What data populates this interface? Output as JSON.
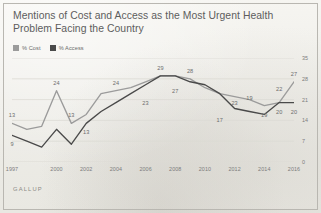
{
  "title": {
    "line1": "Mentions of Cost and Access as the Most Urgent Health",
    "line2": "Problem Facing the Country"
  },
  "legend": {
    "items": [
      {
        "label": "% Cost",
        "color": "#9b9b9b",
        "swatch_icon": "square-swatch-icon"
      },
      {
        "label": "% Access",
        "color": "#4a4a4a",
        "swatch_icon": "square-swatch-icon"
      }
    ]
  },
  "footer": {
    "brand": "GALLUP"
  },
  "colors": {
    "background": "#f2f1ed",
    "gridline": "#dcdad4",
    "axis_text": "#7c7c7c",
    "title_text": "#5d5d5d",
    "label_text": "#6d6d6d",
    "cost_line": "#9b9b9b",
    "access_line": "#4a4a4a"
  },
  "chart_data": {
    "type": "line",
    "title": "Mentions of Cost and Access as the Most Urgent Health Problem Facing the Country",
    "xlabel": "",
    "ylabel": "",
    "ylim": [
      0,
      35
    ],
    "yticks": [
      0,
      7,
      14,
      21,
      28,
      35
    ],
    "ytick_labels": [
      "0",
      "7",
      "14",
      "21",
      "28",
      "35"
    ],
    "y_axis_position": "right",
    "grid": true,
    "legend_position": "top-left",
    "x": [
      1997,
      1998,
      1999,
      2000,
      2001,
      2002,
      2003,
      2004,
      2005,
      2006,
      2007,
      2008,
      2009,
      2010,
      2011,
      2012,
      2013,
      2014,
      2015,
      2016
    ],
    "xtick_labels": [
      "1997",
      "2000",
      "2002",
      "2004",
      "2006",
      "2008",
      "2010",
      "2012",
      "2014",
      "2016"
    ],
    "xticks": [
      1997,
      2000,
      2002,
      2004,
      2006,
      2008,
      2010,
      2012,
      2014,
      2016
    ],
    "series": [
      {
        "name": "% Cost",
        "color": "#9b9b9b",
        "values": [
          13,
          11,
          12,
          24,
          13,
          16,
          23,
          24,
          25,
          27,
          29,
          29,
          28,
          25,
          23,
          22,
          21,
          19,
          20,
          27
        ],
        "labels": [
          {
            "x": 1997,
            "y": 13,
            "text": "13"
          },
          {
            "x": 2000,
            "y": 24,
            "text": "24"
          },
          {
            "x": 2001,
            "y": 13,
            "text": "13"
          },
          {
            "x": 2004,
            "y": 24,
            "text": "24"
          },
          {
            "x": 2007,
            "y": 29,
            "text": "29"
          },
          {
            "x": 2009,
            "y": 28,
            "text": "28"
          },
          {
            "x": 2013,
            "y": 19,
            "text": "19"
          },
          {
            "x": 2015,
            "y": 22,
            "text": "22"
          },
          {
            "x": 2016,
            "y": 27,
            "text": "27"
          }
        ]
      },
      {
        "name": "% Access",
        "color": "#4a4a4a",
        "values": [
          9,
          7,
          5,
          11,
          6,
          13,
          17,
          20,
          23,
          26,
          29,
          29,
          27,
          26,
          23,
          18,
          17,
          16,
          20,
          20
        ],
        "labels": [
          {
            "x": 1997,
            "y": 9,
            "text": "9"
          },
          {
            "x": 2002,
            "y": 13,
            "text": "13"
          },
          {
            "x": 2006,
            "y": 23,
            "text": "23"
          },
          {
            "x": 2008,
            "y": 27,
            "text": "27"
          },
          {
            "x": 2011,
            "y": 17,
            "text": "17"
          },
          {
            "x": 2012,
            "y": 23,
            "text": "23"
          },
          {
            "x": 2014,
            "y": 19,
            "text": "19"
          },
          {
            "x": 2015,
            "y": 20,
            "text": "20"
          },
          {
            "x": 2016,
            "y": 20,
            "text": "20"
          }
        ]
      }
    ],
    "annotations": []
  }
}
